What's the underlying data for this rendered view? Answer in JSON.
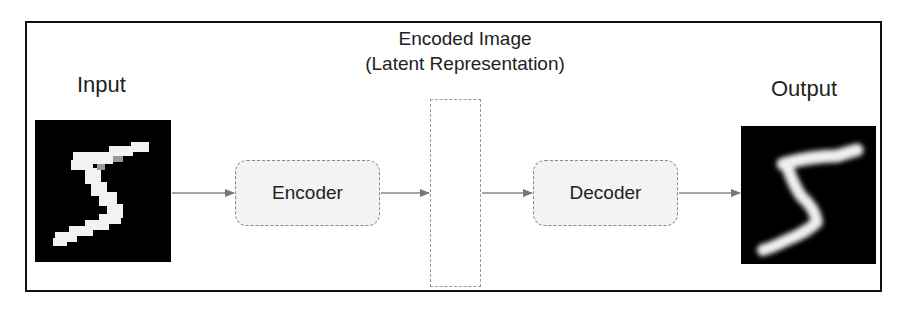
{
  "diagram": {
    "input_label": "Input",
    "output_label": "Output",
    "encoder_label": "Encoder",
    "decoder_label": "Decoder",
    "latent_caption_line1": "Encoded Image",
    "latent_caption_line2": "(Latent Representation)",
    "input_image": "handwritten-digit-5 (MNIST, pixelated)",
    "output_image": "handwritten-digit-5 (reconstructed, blurred)",
    "flow": [
      "Input",
      "Encoder",
      "Encoded Image (Latent Representation)",
      "Decoder",
      "Output"
    ],
    "colors": {
      "frame": "#111111",
      "box_fill": "#f3f3f3",
      "box_border": "#888888",
      "arrow": "#777777",
      "image_bg": "#000000",
      "digit": "#ffffff"
    }
  }
}
